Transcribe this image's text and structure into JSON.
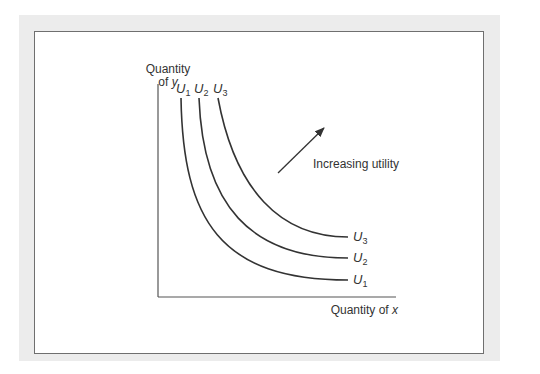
{
  "chart_data": {
    "type": "line",
    "title": "",
    "xlabel": "Quantity of x",
    "ylabel_line1": "Quantity",
    "ylabel_line2_prefix": "of ",
    "ylabel_line2_var": "y",
    "xlabel_prefix": "Quantity of ",
    "xlabel_var": "x",
    "annotation": "Increasing utility",
    "grid": false,
    "series": [
      {
        "name": "U1",
        "var": "U",
        "sub": "1",
        "k": 1
      },
      {
        "name": "U2",
        "var": "U",
        "sub": "2",
        "k": 2
      },
      {
        "name": "U3",
        "var": "U",
        "sub": "3",
        "k": 3
      }
    ]
  },
  "colors": {
    "line": "#333333",
    "panel": "#ececec",
    "border": "#6f6f6f"
  }
}
